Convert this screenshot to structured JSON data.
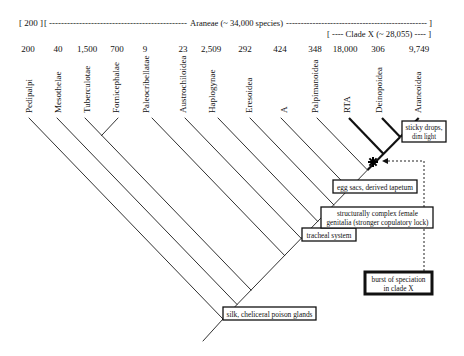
{
  "header": {
    "outgroup_bracket": "[ 200 ]",
    "open_bracket": "[",
    "left_dashes": "----------------------------------------------",
    "title": "Araneae (~ 34,000 species)",
    "right_dashes": "------------------------------------------------",
    "close_bracket": "]",
    "clade_x": "[ ---- Clade X (~ 28,055) ---- ]"
  },
  "taxa": [
    {
      "name": "Pedipalpi",
      "species": "200"
    },
    {
      "name": "Mesothelae",
      "species": "40"
    },
    {
      "name": "Tuberculotae",
      "species": "1,500"
    },
    {
      "name": "Fornicephalae",
      "species": "700"
    },
    {
      "name": "Paleocribellatae",
      "species": "9"
    },
    {
      "name": "Austrochiloidea",
      "species": "23"
    },
    {
      "name": "Haplogynae",
      "species": "2,509"
    },
    {
      "name": "Eresoidea",
      "species": "292"
    },
    {
      "name": "A",
      "species": "424"
    },
    {
      "name": "Palpimanoidea",
      "species": "348"
    },
    {
      "name": "RTA",
      "species": "18,000"
    },
    {
      "name": "Deinopoidea",
      "species": "306"
    },
    {
      "name": "Araneoidea",
      "species": "9,749"
    }
  ],
  "characters": [
    {
      "lines": [
        "silk, cheliceral poison glands"
      ]
    },
    {
      "lines": [
        "tracheal system"
      ]
    },
    {
      "lines": [
        "structurally complex female",
        "genitalia (stronger copulatory lock)"
      ]
    },
    {
      "lines": [
        "egg sacs, derived tapetum"
      ]
    },
    {
      "lines": [
        "sticky drops,",
        "dim light"
      ]
    }
  ],
  "annotation": {
    "lines": [
      "burst of speciation",
      "in clade X"
    ],
    "marker_icon": "asterisk-icon"
  },
  "colors": {
    "line": "#1a1a1a",
    "background": "#ffffff"
  }
}
